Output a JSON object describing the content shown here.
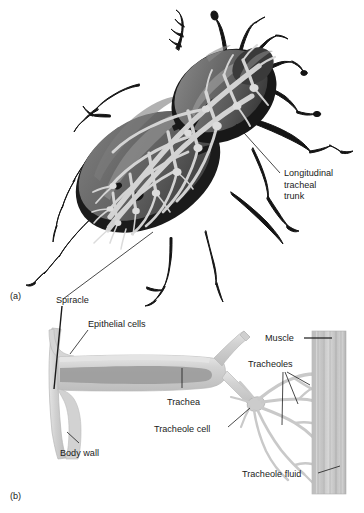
{
  "figure": {
    "panels": [
      {
        "id": "a",
        "label": "(a)",
        "caption": "Whole-insect tracheal network"
      },
      {
        "id": "b",
        "label": "(b)",
        "caption": "Detail of spiracle, trachea and tracheoles"
      }
    ]
  },
  "panel_a": {
    "label": "(a)",
    "labels": [
      {
        "name": "longitudinal-tracheal-trunk",
        "text_lines": [
          "Longitudinal",
          "tracheal",
          "trunk"
        ]
      }
    ]
  },
  "panel_b": {
    "label": "(b)",
    "labels": [
      {
        "name": "spiracle",
        "text": "Spiracle"
      },
      {
        "name": "epithelial-cells",
        "text": "Epithelial cells"
      },
      {
        "name": "body-wall",
        "text": "Body wall"
      },
      {
        "name": "trachea",
        "text": "Trachea"
      },
      {
        "name": "tracheole-cell",
        "text": "Tracheole cell"
      },
      {
        "name": "muscle",
        "text": "Muscle"
      },
      {
        "name": "tracheoles",
        "text": "Tracheoles"
      },
      {
        "name": "tracheole-fluid",
        "text": "Tracheole fluid"
      }
    ]
  },
  "colors": {
    "background": "#ffffff",
    "text": "#1a1a1a",
    "leader_line": "#1a1a1a",
    "beetle_outline": "#111111",
    "beetle_body_dark": "#1c1c1c",
    "beetle_body_mid": "#6e6e6e",
    "beetle_body_light": "#8f8f8f",
    "beetle_highlight": "#a8a8a8",
    "trachea_network": "#d8d8d8",
    "trachea_network_edge": "#bfbfbf",
    "tube_fill": "#d4d4d4",
    "tube_edge": "#b4b4b4",
    "tube_lumen": "#9a9a9a",
    "muscle_fill": "#c8c8c8",
    "muscle_stripe": "#aeaeae"
  }
}
